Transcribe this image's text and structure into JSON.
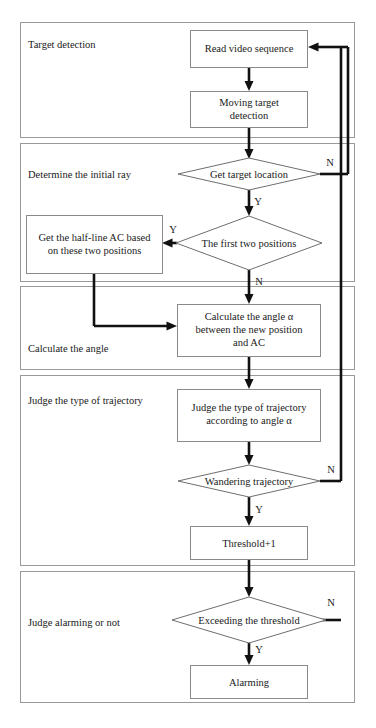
{
  "diagram": {
    "background_color": "#ffffff",
    "line_color": "#111111",
    "group_border_color": "#999999",
    "node_border_color": "#8a8a8a"
  },
  "groups": [
    {
      "id": "g1",
      "label": "Target detection"
    },
    {
      "id": "g2",
      "label": "Determine the initial ray"
    },
    {
      "id": "g3",
      "label": "Calculate the angle"
    },
    {
      "id": "g4",
      "label": "Judge the type of trajectory"
    },
    {
      "id": "g5",
      "label": "Judge alarming or not"
    }
  ],
  "nodes": [
    {
      "id": "n1",
      "type": "process",
      "lines": [
        "Read video sequence"
      ]
    },
    {
      "id": "n2",
      "type": "process",
      "lines": [
        "Moving target",
        "detection"
      ]
    },
    {
      "id": "n3",
      "type": "decision",
      "lines": [
        "Get target location"
      ]
    },
    {
      "id": "n4",
      "type": "decision",
      "lines": [
        "The first two positions"
      ]
    },
    {
      "id": "n5",
      "type": "process",
      "lines": [
        "Get the half-line AC based",
        "on these two positions"
      ]
    },
    {
      "id": "n6",
      "type": "process",
      "lines": [
        "Calculate the angle  α",
        "between the new position",
        "and AC"
      ]
    },
    {
      "id": "n7",
      "type": "process",
      "lines": [
        "Judge the type of trajectory",
        "according to angle  α"
      ]
    },
    {
      "id": "n8",
      "type": "decision",
      "lines": [
        "Wandering trajectory"
      ]
    },
    {
      "id": "n9",
      "type": "process",
      "lines": [
        "Threshold+1"
      ]
    },
    {
      "id": "n10",
      "type": "decision",
      "lines": [
        "Exceeding the threshold"
      ]
    },
    {
      "id": "n11",
      "type": "process",
      "lines": [
        "Alarming"
      ]
    }
  ],
  "branch_labels": {
    "n3_no": "N",
    "n3_yes": "Y",
    "n4_yes": "Y",
    "n4_no": "N",
    "n8_no": "N",
    "n8_yes": "Y",
    "n10_no": "N",
    "n10_yes": "Y"
  }
}
